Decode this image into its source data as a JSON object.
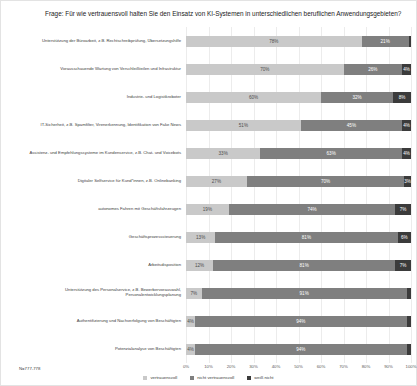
{
  "figure": {
    "title": "Frage: Für wie vertrauensvoll halten Sie den Einsatz von KI-Systemen in unterschiedlichen beruflichen Anwendungsgebieten?",
    "footnote": "N=777-778"
  },
  "chart_data": {
    "type": "bar",
    "orientation": "horizontal",
    "stacked": true,
    "title": "Frage: Für wie vertrauensvoll halten Sie den Einsatz von KI-Systemen in unterschiedlichen beruflichen Anwendungsgebieten?",
    "categories": [
      "Unterstützung der Büroarbeit, z.B. Rechtschreibprüfung, Übersetzungshilfe",
      "Vorausschauende Wartung von Verschleißteilen und Infrastruktur",
      "Industrie- und Logistikroboter",
      "IT-Sicherheit, z.B. Spamfilter, Virenerkennung, Identifikation von Fake News",
      "Assistenz- und Empfehlungssysteme im Kundenservice, z.B. Chat- und Voicebots",
      "Digitaler Selfservice für Kund*innen, z.B. Onlinebanking",
      "autonomes Fahren mit Geschäftsfahrzeugen",
      "Geschäftsprozesssteuerung",
      "Arbeitsdisposition",
      "Unterstützung des Personalservice, z.B. Bewerbervorauswahl, Personalentwicklungsplanung",
      "Authentifizierung und Nachverfolgung von Beschäftigten",
      "Potenzialanalyse von Beschäftigten"
    ],
    "series": [
      {
        "name": "vertrauensvoll",
        "color": "#c9c9c9",
        "values": [
          78,
          70,
          60,
          51,
          33,
          27,
          19,
          13,
          12,
          7,
          4,
          4
        ]
      },
      {
        "name": "nicht vertrauensvoll",
        "color": "#7f7f7f",
        "values": [
          21,
          26,
          32,
          45,
          63,
          70,
          74,
          81,
          81,
          91,
          94,
          94
        ]
      },
      {
        "name": "weiß nicht",
        "color": "#3b3b3b",
        "values": [
          1,
          4,
          8,
          4,
          4,
          3,
          7,
          6,
          7,
          2,
          2,
          2
        ]
      }
    ],
    "xlabel": "",
    "ylabel": "",
    "xlim": [
      0,
      100
    ],
    "x_ticks": [
      "0%",
      "10%",
      "20%",
      "30%",
      "40%",
      "50%",
      "60%",
      "70%",
      "80%",
      "90%",
      "100%"
    ],
    "grid": true,
    "legend_position": "bottom",
    "value_label_format": "percent"
  }
}
